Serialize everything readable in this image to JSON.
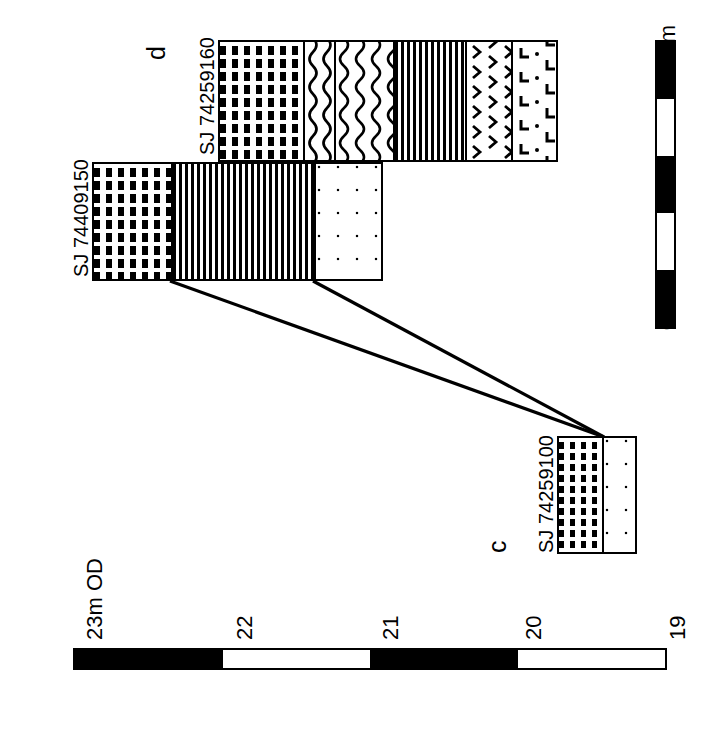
{
  "figure": {
    "type": "geological-cross-section",
    "orientation": "rotated-90-ccw",
    "section_labels": [
      {
        "id": "d",
        "text": "d"
      },
      {
        "id": "c",
        "text": "c"
      }
    ]
  },
  "boreholes": [
    {
      "id": "bh-74259160",
      "label": "SJ 74259160",
      "section": "d",
      "bands": [
        {
          "name": "laminated-silt",
          "pattern": "dash",
          "width_pct": 24.7
        },
        {
          "name": "organic-peat-a",
          "pattern": "wavy",
          "width_pct": 9.1
        },
        {
          "name": "organic-peat-b",
          "pattern": "wavy",
          "width_pct": 17.6
        },
        {
          "name": "organic-mud",
          "pattern": "stipple",
          "width_pct": 21.5
        },
        {
          "name": "gravelly-clay",
          "pattern": "chevron",
          "width_pct": 13.8
        },
        {
          "name": "made-ground",
          "pattern": "ell-dot",
          "width_pct": 13.3
        }
      ]
    },
    {
      "id": "bh-74409150",
      "label": "SJ 74409150",
      "section": "d",
      "bands": [
        {
          "name": "laminated-silt",
          "pattern": "dash",
          "width_pct": 26.9
        },
        {
          "name": "organic-mud",
          "pattern": "stipple",
          "width_pct": 49.7
        },
        {
          "name": "sand",
          "pattern": "dots",
          "width_pct": 23.4
        }
      ]
    },
    {
      "id": "bh-74259100",
      "label": "SJ 74259100",
      "section": "c",
      "bands": [
        {
          "name": "laminated-silt",
          "pattern": "dash-small",
          "width_pct": 56.0
        },
        {
          "name": "sand",
          "pattern": "dots",
          "width_pct": 44.0
        }
      ]
    }
  ],
  "distance_scale": {
    "name": "distance-scale",
    "max_label": "500m",
    "min_label": "0",
    "segments": [
      "black",
      "white",
      "black",
      "white",
      "black"
    ]
  },
  "elevation_scale": {
    "name": "elevation-scale",
    "top_label": "23m  OD",
    "ticks": [
      "23m  OD",
      "22",
      "21",
      "20",
      "19"
    ],
    "segments": [
      "black",
      "white",
      "black",
      "white"
    ]
  },
  "colors": {
    "ink": "#000000",
    "paper": "#ffffff"
  }
}
